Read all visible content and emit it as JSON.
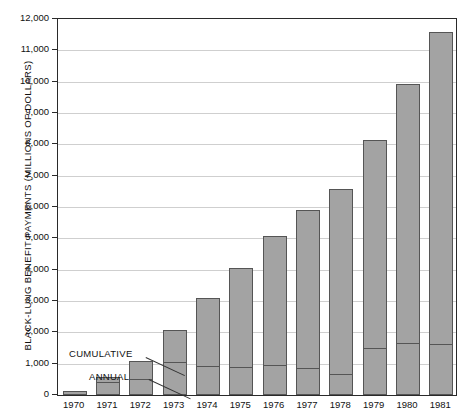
{
  "chart_data": {
    "type": "bar",
    "title": "",
    "xlabel": "",
    "ylabel": "BLACK-LUNG BENEFIT PAYMENTS (MILLIONS OF DOLLARS)",
    "ylim": [
      0,
      12000
    ],
    "ytick_labels": [
      "12,000",
      "11,000",
      "10,000",
      "9,000",
      "8,000",
      "7,000",
      "6,000",
      "5,000",
      "4,000",
      "3,000",
      "2,000",
      "1,000",
      "0"
    ],
    "ytick_values": [
      12000,
      11000,
      10000,
      9000,
      8000,
      7000,
      6000,
      5000,
      4000,
      3000,
      2000,
      1000,
      0
    ],
    "grid": true,
    "legend_position": "inline-annotations",
    "categories": [
      "1970",
      "1971",
      "1972",
      "1973",
      "1974",
      "1975",
      "1976",
      "1977",
      "1978",
      "1979",
      "1980",
      "1981"
    ],
    "series": [
      {
        "name": "CUMULATIVE",
        "values": [
          140,
          570,
          1080,
          2080,
          3100,
          4040,
          5080,
          5900,
          6580,
          8150,
          9920,
          11600
        ]
      },
      {
        "name": "ANNUAL",
        "values": [
          140,
          430,
          510,
          1060,
          930,
          900,
          960,
          860,
          670,
          1500,
          1650,
          1620
        ]
      }
    ],
    "annotations": [
      {
        "label": "CUMULATIVE",
        "target_category": "1972"
      },
      {
        "label": "ANNUAL",
        "target_category": "1972"
      }
    ],
    "colors": {
      "bar_fill": "#a3a3a3",
      "bar_stroke": "#555555",
      "grid": "#cfcfcf",
      "axis": "#2a2a2a",
      "text": "#111111"
    }
  }
}
